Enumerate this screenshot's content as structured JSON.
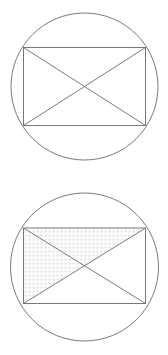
{
  "canvas": {
    "width": 168,
    "height": 355,
    "background": "#ffffff"
  },
  "style": {
    "stroke_color": "#6b6b6b",
    "stroke_width": 0.9,
    "fill_none": "none",
    "dot_color": "#7a7a7a",
    "dot_radius": 0.55,
    "dot_spacing": 4
  },
  "figures": [
    {
      "id": "figure-1",
      "caption": "",
      "description": "Circle with inscribed rectangle and both diagonals drawn",
      "panel": {
        "x": 0,
        "y": 0,
        "width": 168,
        "height": 178
      },
      "circle": {
        "cx": 84.5,
        "cy": 86.5,
        "r": 73.5
      },
      "rectangle": {
        "x1": 23.5,
        "y1": 47.5,
        "x2": 145.5,
        "y2": 125.5
      },
      "diagonals": [
        {
          "name": "diagonal-major",
          "from": "top-left",
          "to": "bottom-right"
        },
        {
          "name": "diagonal-minor",
          "from": "bottom-left",
          "to": "top-right"
        }
      ],
      "shaded_region": null
    },
    {
      "id": "figure-2",
      "caption": "",
      "description": "Circle with inscribed rectangle, both diagonals drawn, and the triangle above the major diagonal filled with a dotted stipple pattern",
      "panel": {
        "x": 0,
        "y": 178,
        "width": 168,
        "height": 177
      },
      "circle": {
        "cx": 84.5,
        "cy": 89.0,
        "r": 74.0
      },
      "rectangle": {
        "x1": 23.5,
        "y1": 50.0,
        "x2": 145.5,
        "y2": 125.5
      },
      "diagonals": [
        {
          "name": "diagonal-major",
          "from": "top-left",
          "to": "bottom-right"
        },
        {
          "name": "diagonal-minor",
          "from": "bottom-left",
          "to": "top-right"
        }
      ],
      "shaded_region": {
        "name": "shaded-triangle",
        "fill_style": "dotted-stipple",
        "vertices": [
          "top-left",
          "top-right",
          "bottom-left"
        ],
        "points": "23.5,50.0 145.5,50.0 23.5,125.5"
      }
    }
  ]
}
